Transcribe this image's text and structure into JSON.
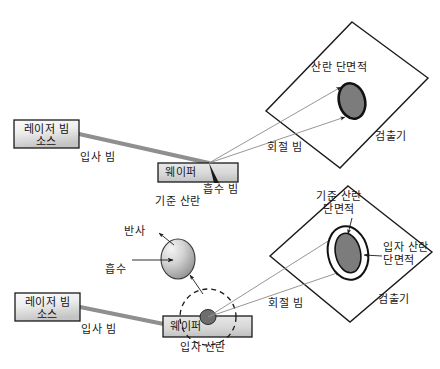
{
  "figure": {
    "title": "",
    "type": "optical-scattering-schematic",
    "panels": [
      {
        "id": "top-panel",
        "caption": "기준 산란",
        "components": {
          "laser_source": "레이저 빔\n소스",
          "incident_beam": "입사 빔",
          "wafer": "웨이퍼",
          "absorbed_beam": "흡수 빔",
          "diffracted_beam": "회절 빔",
          "detector": "검출기",
          "cross_section": "산란 단면적"
        }
      },
      {
        "id": "bottom-panel",
        "caption": "입자 산란",
        "components": {
          "laser_source": "레이저 빔\n소스",
          "incident_beam": "입사 빔",
          "wafer": "웨이퍼",
          "reflection": "반사",
          "absorption": "흡수",
          "diffracted_beam": "회절 빔",
          "detector": "검출기",
          "reference_cross_section": "기준 산란\n단면적",
          "particle_cross_section": "입자 산란\n단면적"
        }
      }
    ]
  },
  "colors": {
    "stroke": "#1a1a1a",
    "beam": "#8a8a8a",
    "box_fill_light": "#f2f2f2",
    "box_fill_dark": "#c9c9c9",
    "ellipse_dark": "#707070",
    "ellipse_mid": "#9a9a9a",
    "particle": "#6e6e6e",
    "background": "#ffffff"
  },
  "labels": {
    "laser_top": "레이저 빔\n소스",
    "laser_bottom": "레이저 빔\n소스",
    "incident_top": "입사 빔",
    "incident_bottom": "입사 빔",
    "wafer_top": "웨이퍼",
    "wafer_bottom": "웨이퍼",
    "absorbed_beam": "흡수 빔",
    "reference_scattering": "기준 산란",
    "particle_scattering": "입자 산란",
    "diffracted_top": "회절 빔",
    "diffracted_bottom": "회절 빔",
    "detector_top": "검출기",
    "detector_bottom": "검출기",
    "scattering_cross_section": "산란 단면적",
    "reference_cross_section": "기준 산란\n단면적",
    "particle_cross_section": "입자 산란\n단면적",
    "reflection": "반사",
    "absorption": "흡수"
  }
}
